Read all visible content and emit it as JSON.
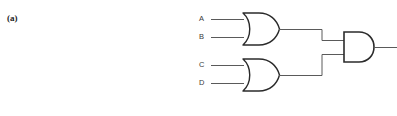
{
  "figure": {
    "part_label": "(a)",
    "background_color": "#ffffff",
    "line_color": "#4a4a4a",
    "gate_stroke_color": "#2b2b2b",
    "label_color": "#3a3a3a",
    "width": 397,
    "height": 116
  },
  "circuit": {
    "description": "Two-level combinational logic: two OR gates feeding one AND gate",
    "inputs": [
      {
        "name": "A",
        "label": "A",
        "x": 199,
        "y": 15,
        "wire_y": 19.5,
        "wire_x_start": 211,
        "wire_x_end": 243
      },
      {
        "name": "B",
        "label": "B",
        "x": 199,
        "y": 33,
        "wire_y": 37.5,
        "wire_x_start": 211,
        "wire_x_end": 243
      },
      {
        "name": "C",
        "label": "C",
        "x": 199,
        "y": 61,
        "wire_y": 65.5,
        "wire_x_start": 211,
        "wire_x_end": 243
      },
      {
        "name": "D",
        "label": "D",
        "x": 199,
        "y": 79,
        "wire_y": 83.5,
        "wire_x_start": 211,
        "wire_x_end": 243
      }
    ],
    "gates": [
      {
        "id": "or-gate-top",
        "type": "OR",
        "inputs": [
          "A",
          "B"
        ],
        "x": 243,
        "y": 13,
        "width": 36,
        "height": 33,
        "output_y": 29.5,
        "output_x": 279
      },
      {
        "id": "or-gate-bottom",
        "type": "OR",
        "inputs": [
          "C",
          "D"
        ],
        "x": 243,
        "y": 59,
        "width": 36,
        "height": 33,
        "output_y": 75.5,
        "output_x": 279
      },
      {
        "id": "and-gate-output",
        "type": "AND",
        "inputs": [
          "or-gate-top",
          "or-gate-bottom"
        ],
        "x": 344,
        "y": 32,
        "width": 30,
        "height": 30,
        "input_top_y": 40.5,
        "input_bottom_y": 54.5,
        "output_y": 47.5,
        "output_x": 374
      }
    ],
    "wires": {
      "top_or_to_and": {
        "from_x": 279,
        "from_y": 29.5,
        "corner_x": 322,
        "to_y": 40.5,
        "to_x": 344
      },
      "bottom_or_to_and": {
        "from_x": 279,
        "from_y": 75.5,
        "corner_x": 322,
        "to_y": 54.5,
        "to_x": 344
      },
      "output": {
        "from_x": 374,
        "from_y": 47.5,
        "to_x": 397
      }
    }
  }
}
